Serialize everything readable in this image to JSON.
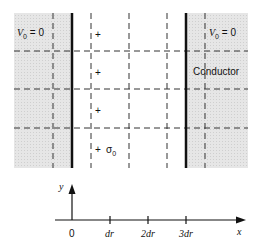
{
  "diagram": {
    "regions": {
      "left_conductor": {
        "label_V": "V",
        "label_sub": "0",
        "label_eq": " = 0"
      },
      "right_conductor": {
        "label_V": "V",
        "label_sub": "0",
        "label_eq": " = 0",
        "name": "Conductor"
      }
    },
    "charges": [
      "+",
      "+",
      "+",
      "+"
    ],
    "sigma_label": {
      "symbol": "σ",
      "sub": "0"
    },
    "axis": {
      "y_label": "y",
      "x_label": "x",
      "ticks": [
        "0",
        "dr",
        "2dr",
        "3dr"
      ]
    },
    "colors": {
      "shade": "#e4e4e4",
      "line": "#111111",
      "dash": "#333333"
    }
  }
}
